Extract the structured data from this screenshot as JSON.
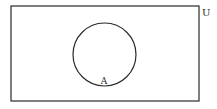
{
  "diagram": {
    "type": "venn",
    "universal_set": {
      "label": "U",
      "x": 11,
      "y": 6,
      "width": 188,
      "height": 95
    },
    "sets": [
      {
        "label": "A",
        "cx": 104.5,
        "cy": 54.5,
        "r": 31.5,
        "label_x": 104,
        "label_y": 84
      }
    ],
    "colors": {
      "stroke": "#2a2a2a",
      "background": "#ffffff"
    }
  }
}
